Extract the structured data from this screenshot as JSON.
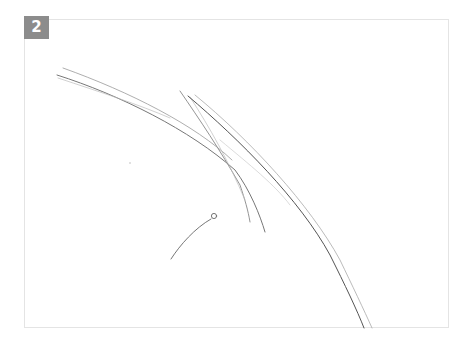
{
  "step": {
    "number": "2",
    "badge_color": "#8c8c8c"
  },
  "frame": {
    "border_color": "#e4e4e4",
    "background": "#ffffff"
  },
  "sketch": {
    "description": "pencil sketch: long sweeping curves (Z-shaped construction strokes) and a short stroke ending in a small circle",
    "stroke_color": "#555555"
  }
}
